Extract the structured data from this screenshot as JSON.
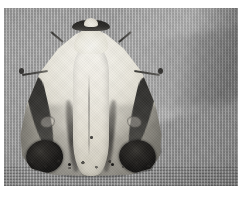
{
  "image": {
    "kind": "photograph",
    "subject": "moth",
    "color_mode": "grayscale",
    "orientation": "landscape",
    "width_px": 248,
    "height_px": 199
  },
  "plate": {
    "border_color": "#ffffff",
    "border_top_px": 8,
    "border_left_px": 4,
    "border_right_px": 10,
    "border_bottom_px": 13
  },
  "background": {
    "name": "woven-fabric-mesh",
    "description": "fine woven screen / cloth mesh",
    "base_color": "#bdbdbd",
    "highlight_color": "#d4d4d4",
    "shadow_color": "#9d9d9d",
    "has_diagonal_fold": true
  },
  "subject": {
    "name": "moth",
    "pose": "wings-folded-triangular",
    "body_color": "#efecE2",
    "wing_pale_color": "#e7e4d9",
    "marking_dark_color": "#2d2c2a",
    "blotch_color": "#1b1a18",
    "parts": [
      {
        "name": "head-band",
        "color": "#201f1d"
      },
      {
        "name": "head-tuft",
        "color": "#f3f1e9"
      },
      {
        "name": "thorax",
        "color": "#f7f6f1"
      },
      {
        "name": "abdomen",
        "color": "#eeebe2"
      },
      {
        "name": "left-forewing",
        "color": "#e7e4d9"
      },
      {
        "name": "right-forewing",
        "color": "#e7e4d9"
      },
      {
        "name": "left-wing-bar",
        "color": "#2d2c2a"
      },
      {
        "name": "right-wing-bar",
        "color": "#2d2c2a"
      },
      {
        "name": "left-wing-blotch",
        "color": "#141312"
      },
      {
        "name": "right-wing-blotch",
        "color": "#141312"
      },
      {
        "name": "left-ring-spot",
        "color": "#282623"
      },
      {
        "name": "right-ring-spot",
        "color": "#282623"
      },
      {
        "name": "left-antenna",
        "color": "#23221f"
      },
      {
        "name": "right-antenna",
        "color": "#23221f"
      },
      {
        "name": "wing-fringe-speckles",
        "color": "#282623"
      }
    ]
  }
}
